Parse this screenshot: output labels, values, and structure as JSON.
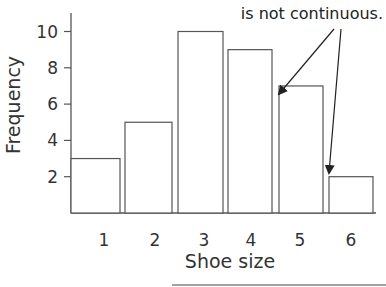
{
  "chart_data": {
    "type": "bar",
    "title": "",
    "xlabel": "Shoe size",
    "ylabel": "Frequency",
    "categories": [
      "1",
      "2",
      "3",
      "4",
      "5",
      "6"
    ],
    "values": [
      3,
      5,
      10,
      9,
      7,
      2
    ],
    "yticks": [
      "2",
      "4",
      "6",
      "8",
      "10"
    ],
    "ylim": [
      0,
      11
    ],
    "grid": false,
    "legend": null,
    "annotations": [
      {
        "text": "is not continuous.",
        "arrows_to": [
          "gap between bars 4 and 5",
          "gap between bars 5 and 6"
        ]
      }
    ]
  },
  "annotation_text": "is not continuous."
}
